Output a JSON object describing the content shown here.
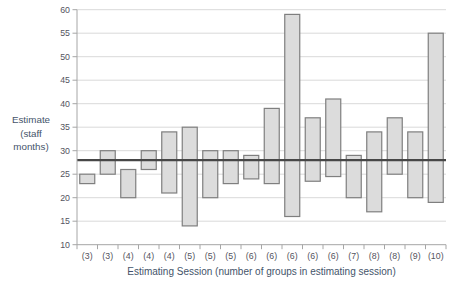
{
  "chart_data": {
    "type": "bar",
    "subtype": "floating-range-bars",
    "title": "",
    "xlabel": "Estimating Session (number of groups in estimating session)",
    "ylabel": "Estimate (staff months)",
    "ylabel_lines": [
      "Estimate",
      "(staff",
      "months)"
    ],
    "ylim": [
      10,
      60
    ],
    "yticks": [
      10,
      15,
      20,
      25,
      30,
      35,
      40,
      45,
      50,
      55,
      60
    ],
    "grid": true,
    "legend": "none",
    "categories": [
      "(3)",
      "(3)",
      "(4)",
      "(4)",
      "(4)",
      "(5)",
      "(5)",
      "(5)",
      "(6)",
      "(6)",
      "(6)",
      "(6)",
      "(6)",
      "(7)",
      "(8)",
      "(8)",
      "(9)",
      "(10)"
    ],
    "series": [
      {
        "name": "estimate-range",
        "ranges": [
          [
            23,
            25
          ],
          [
            25,
            30
          ],
          [
            20,
            26
          ],
          [
            26,
            30
          ],
          [
            21,
            34
          ],
          [
            14,
            35
          ],
          [
            20,
            30
          ],
          [
            23,
            30
          ],
          [
            24,
            29
          ],
          [
            23,
            39
          ],
          [
            16,
            59
          ],
          [
            23.5,
            37
          ],
          [
            24.5,
            41
          ],
          [
            20,
            29
          ],
          [
            17,
            34
          ],
          [
            25,
            37
          ],
          [
            20,
            34
          ],
          [
            19,
            55
          ]
        ]
      }
    ],
    "reference_line": {
      "value": 28
    },
    "colors": {
      "bar_fill": "#dcdcdc",
      "bar_border": "#7f7f7f",
      "gridline": "#d9d9d9",
      "axis_line": "#a6a6a6",
      "tick_label": "#54545e",
      "axis_title": "#44546a",
      "reference_line": "#474747"
    }
  }
}
